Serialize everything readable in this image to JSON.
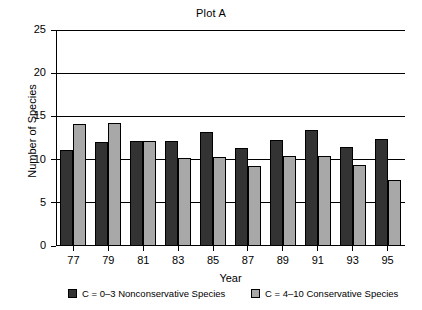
{
  "chart_data": {
    "type": "bar",
    "title": "Plot A",
    "xlabel": "Year",
    "ylabel": "Number of Species",
    "categories": [
      "77",
      "79",
      "81",
      "83",
      "85",
      "87",
      "89",
      "91",
      "93",
      "95"
    ],
    "series": [
      {
        "name": "C = 0–3 Nonconservative Species",
        "color": "#333333",
        "values": [
          11.1,
          12.0,
          12.1,
          12.2,
          13.2,
          11.3,
          12.3,
          13.4,
          11.5,
          12.4
        ]
      },
      {
        "name": "C = 4–10 Conservative Species",
        "color": "#a8a8a8",
        "values": [
          14.1,
          14.2,
          12.1,
          10.2,
          10.3,
          9.3,
          10.4,
          10.4,
          9.4,
          7.6
        ]
      }
    ],
    "ylim": [
      0,
      25
    ],
    "yticks": [
      0,
      5,
      10,
      15,
      20,
      25
    ],
    "ytick_labels": [
      "0",
      "5",
      "10",
      "15",
      "20",
      "25"
    ],
    "grid": true,
    "grid_axis": "y",
    "legend_position": "below"
  },
  "legend": {
    "entries": [
      {
        "label": "C = 0–3 Nonconservative Species",
        "swatch": "dark"
      },
      {
        "label": "C = 4–10 Conservative Species",
        "swatch": "light"
      }
    ]
  }
}
